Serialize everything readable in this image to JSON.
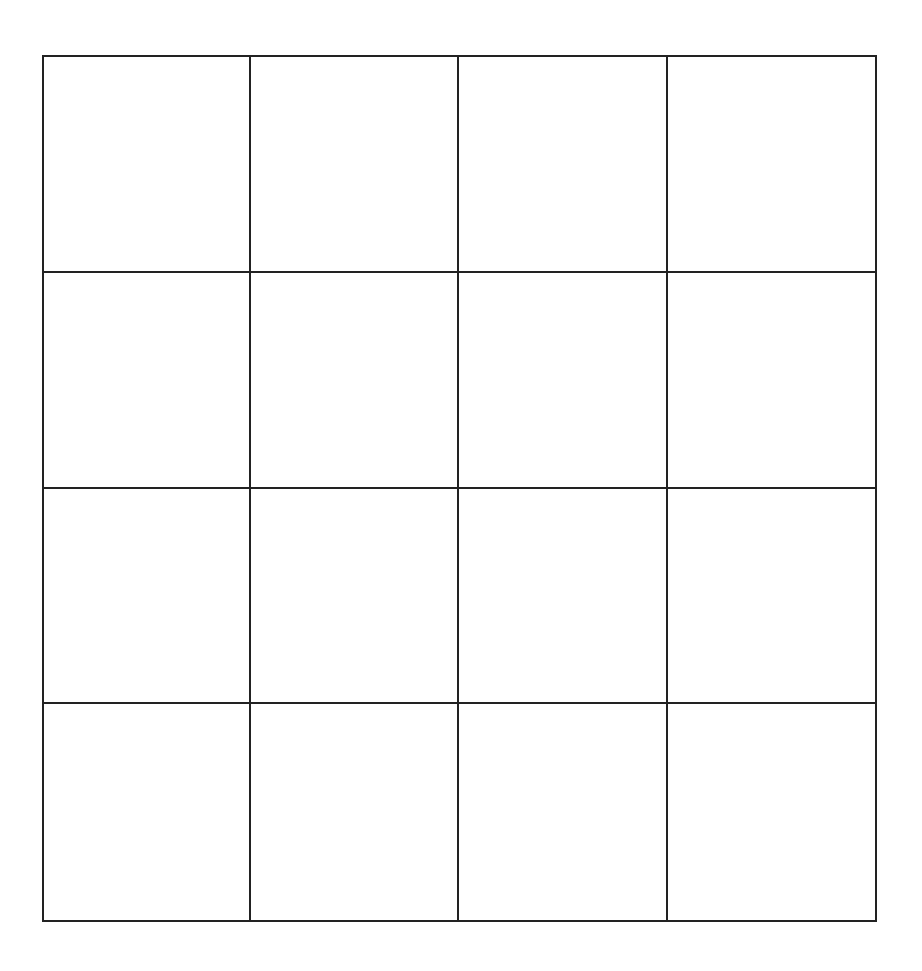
{
  "diagram": {
    "type": "empty-grid",
    "rows": 4,
    "columns": 4,
    "line_color": "#222222",
    "line_width": 2,
    "background": "#ffffff",
    "bounds": {
      "left": 43,
      "top": 56,
      "right": 876,
      "bottom": 921
    },
    "vertical_lines_x": [
      43,
      250,
      458,
      667,
      876
    ],
    "horizontal_lines_y": [
      56,
      272,
      488,
      703,
      921
    ],
    "cells": [
      [
        "",
        "",
        "",
        ""
      ],
      [
        "",
        "",
        "",
        ""
      ],
      [
        "",
        "",
        "",
        ""
      ],
      [
        "",
        "",
        "",
        ""
      ]
    ]
  }
}
